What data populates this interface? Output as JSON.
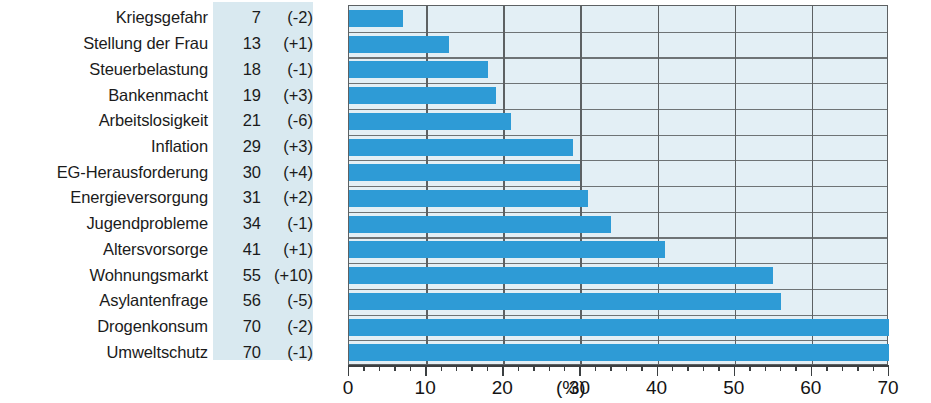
{
  "chart_data": {
    "type": "bar",
    "orientation": "horizontal",
    "title": "",
    "xlabel": "(%)",
    "ylabel": "",
    "xlim": [
      0,
      70
    ],
    "xticks": [
      0,
      10,
      20,
      30,
      40,
      50,
      60,
      70
    ],
    "xtick_labels": [
      "0",
      "10",
      "20",
      "30",
      "40",
      "50",
      "60",
      "70"
    ],
    "minor_tick_step": 2,
    "grid": true,
    "legend": "none",
    "bar_color": "#2e9bd6",
    "plot_background": "#e3eff5",
    "value_column_background": "#d9e9f0",
    "categories": [
      "Kriegsgefahr",
      "Stellung der Frau",
      "Steuerbelastung",
      "Bankenmacht",
      "Arbeitslosigkeit",
      "Inflation",
      "EG-Herausforderung",
      "Energieversorgung",
      "Jugendprobleme",
      "Altersvorsorge",
      "Wohnungsmarkt",
      "Asylantenfrage",
      "Drogenkonsum",
      "Umweltschutz"
    ],
    "values": [
      7,
      13,
      18,
      19,
      21,
      29,
      30,
      31,
      34,
      41,
      55,
      56,
      70,
      70
    ],
    "value_labels": [
      "7",
      "13",
      "18",
      "19",
      "21",
      "29",
      "30",
      "31",
      "34",
      "41",
      "55",
      "56",
      "70",
      "70"
    ],
    "deltas": [
      -2,
      1,
      -1,
      3,
      -6,
      3,
      4,
      2,
      -1,
      1,
      10,
      -5,
      -2,
      -1
    ],
    "delta_labels": [
      "(-2)",
      "(+1)",
      "(-1)",
      "(+3)",
      "(-6)",
      "(+3)",
      "(+4)",
      "(+2)",
      "(-1)",
      "(+1)",
      "(+10)",
      "(-5)",
      "(-2)",
      "(-1)"
    ],
    "rows": [
      {
        "label": "Kriegsgefahr",
        "value": 7,
        "value_label": "7",
        "delta_label": "(-2)"
      },
      {
        "label": "Stellung der Frau",
        "value": 13,
        "value_label": "13",
        "delta_label": "(+1)"
      },
      {
        "label": "Steuerbelastung",
        "value": 18,
        "value_label": "18",
        "delta_label": "(-1)"
      },
      {
        "label": "Bankenmacht",
        "value": 19,
        "value_label": "19",
        "delta_label": "(+3)"
      },
      {
        "label": "Arbeitslosigkeit",
        "value": 21,
        "value_label": "21",
        "delta_label": "(-6)"
      },
      {
        "label": "Inflation",
        "value": 29,
        "value_label": "29",
        "delta_label": "(+3)"
      },
      {
        "label": "EG-Herausforderung",
        "value": 30,
        "value_label": "30",
        "delta_label": "(+4)"
      },
      {
        "label": "Energieversorgung",
        "value": 31,
        "value_label": "31",
        "delta_label": "(+2)"
      },
      {
        "label": "Jugendprobleme",
        "value": 34,
        "value_label": "34",
        "delta_label": "(-1)"
      },
      {
        "label": "Altersvorsorge",
        "value": 41,
        "value_label": "41",
        "delta_label": "(+1)"
      },
      {
        "label": "Wohnungsmarkt",
        "value": 55,
        "value_label": "55",
        "delta_label": "(+10)"
      },
      {
        "label": "Asylantenfrage",
        "value": 56,
        "value_label": "56",
        "delta_label": "(-5)"
      },
      {
        "label": "Drogenkonsum",
        "value": 70,
        "value_label": "70",
        "delta_label": "(-2)"
      },
      {
        "label": "Umweltschutz",
        "value": 70,
        "value_label": "70",
        "delta_label": "(-1)"
      }
    ]
  }
}
